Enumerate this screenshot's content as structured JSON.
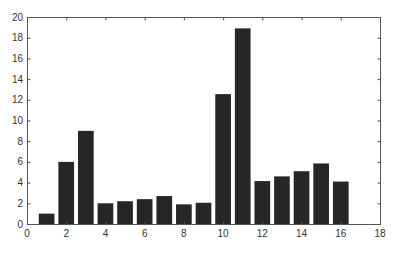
{
  "chart_data": {
    "type": "bar",
    "title": "",
    "xlabel": "",
    "ylabel": "",
    "categories": [
      1,
      2,
      3,
      4,
      5,
      6,
      7,
      8,
      9,
      10,
      11,
      12,
      13,
      14,
      15,
      16
    ],
    "values": [
      1.0,
      6.0,
      9.0,
      2.0,
      2.2,
      2.4,
      2.7,
      1.9,
      2.05,
      12.55,
      18.9,
      4.15,
      4.6,
      5.1,
      5.85,
      4.1
    ],
    "xlim": [
      0,
      18
    ],
    "ylim": [
      0,
      20
    ],
    "xticks": [
      0,
      2,
      4,
      6,
      8,
      10,
      12,
      14,
      16,
      18
    ],
    "yticks": [
      0,
      2,
      4,
      6,
      8,
      10,
      12,
      14,
      16,
      18,
      20
    ],
    "bar_width": 0.8,
    "grid": false,
    "legend": null,
    "bar_color": "#262626",
    "axis_color": "#555555"
  }
}
